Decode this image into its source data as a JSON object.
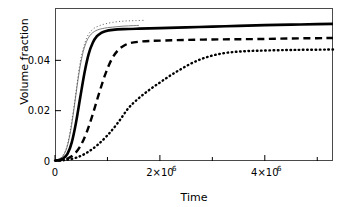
{
  "chart_data": {
    "type": "line",
    "title": "",
    "xlabel": "Time",
    "ylabel": "Volume fraction",
    "xlim": [
      0,
      5300000
    ],
    "ylim": [
      0,
      0.0608
    ],
    "grid": false,
    "legend": "none",
    "xticks": [
      {
        "value": 0,
        "label": "0",
        "major": true
      },
      {
        "value": 1000000,
        "label": "",
        "major": false
      },
      {
        "value": 2000000,
        "label": "2×10",
        "exponent": "6",
        "major": true
      },
      {
        "value": 3000000,
        "label": "",
        "major": false
      },
      {
        "value": 4000000,
        "label": "4×10",
        "exponent": "6",
        "major": true
      },
      {
        "value": 5000000,
        "label": "",
        "major": false
      }
    ],
    "yticks": [
      {
        "value": 0,
        "label": "0"
      },
      {
        "value": 0.02,
        "label": "0.02"
      },
      {
        "value": 0.04,
        "label": "0.04"
      }
    ],
    "series": [
      {
        "name": "thin-solid",
        "style": "solid-thin",
        "color": "#6e6e6e",
        "width": 0.9,
        "points": [
          [
            0,
            0.0003
          ],
          [
            60000,
            0.0006
          ],
          [
            120000,
            0.0013
          ],
          [
            180000,
            0.0029
          ],
          [
            240000,
            0.0063
          ],
          [
            300000,
            0.0122
          ],
          [
            360000,
            0.0204
          ],
          [
            420000,
            0.0296
          ],
          [
            480000,
            0.0377
          ],
          [
            540000,
            0.0436
          ],
          [
            600000,
            0.0474
          ],
          [
            660000,
            0.0497
          ],
          [
            720000,
            0.051
          ],
          [
            780000,
            0.0518
          ],
          [
            840000,
            0.0523
          ],
          [
            900000,
            0.0526
          ],
          [
            1000000,
            0.053
          ],
          [
            1100000,
            0.0532
          ],
          [
            1200000,
            0.0534
          ],
          [
            1300000,
            0.0536
          ],
          [
            1400000,
            0.0537
          ],
          [
            1500000,
            0.0538
          ],
          [
            1600000,
            0.0539
          ]
        ]
      },
      {
        "name": "fine-dotted-overshoot",
        "style": "dotted-fine",
        "color": "#555555",
        "width": 0.9,
        "points": [
          [
            0,
            0.0003
          ],
          [
            120000,
            0.0014
          ],
          [
            240000,
            0.0068
          ],
          [
            360000,
            0.0214
          ],
          [
            480000,
            0.0392
          ],
          [
            600000,
            0.0487
          ],
          [
            720000,
            0.0523
          ],
          [
            840000,
            0.0537
          ],
          [
            960000,
            0.0545
          ],
          [
            1100000,
            0.0551
          ],
          [
            1250000,
            0.0555
          ],
          [
            1400000,
            0.0557
          ],
          [
            1550000,
            0.0558
          ],
          [
            1700000,
            0.0559
          ]
        ]
      },
      {
        "name": "thick-solid",
        "style": "solid-thick",
        "color": "#000000",
        "width": 2.6,
        "points": [
          [
            0,
            0.0002
          ],
          [
            80000,
            0.0004
          ],
          [
            160000,
            0.0011
          ],
          [
            240000,
            0.0029
          ],
          [
            320000,
            0.0074
          ],
          [
            400000,
            0.0152
          ],
          [
            480000,
            0.0251
          ],
          [
            560000,
            0.0348
          ],
          [
            640000,
            0.0424
          ],
          [
            720000,
            0.047
          ],
          [
            800000,
            0.0496
          ],
          [
            880000,
            0.0509
          ],
          [
            960000,
            0.0516
          ],
          [
            1100000,
            0.0521
          ],
          [
            1300000,
            0.0524
          ],
          [
            1600000,
            0.0526
          ],
          [
            2000000,
            0.0528
          ],
          [
            2500000,
            0.0531
          ],
          [
            3000000,
            0.0534
          ],
          [
            3500000,
            0.0537
          ],
          [
            4000000,
            0.054
          ],
          [
            4500000,
            0.0542
          ],
          [
            5000000,
            0.0544
          ],
          [
            5300000,
            0.0545
          ]
        ]
      },
      {
        "name": "dashed",
        "style": "dashed",
        "color": "#000000",
        "width": 2.4,
        "points": [
          [
            0,
            0.0002
          ],
          [
            120000,
            0.0004
          ],
          [
            240000,
            0.001
          ],
          [
            360000,
            0.0026
          ],
          [
            480000,
            0.0058
          ],
          [
            600000,
            0.0112
          ],
          [
            720000,
            0.0186
          ],
          [
            840000,
            0.0269
          ],
          [
            960000,
            0.0345
          ],
          [
            1080000,
            0.0404
          ],
          [
            1200000,
            0.044
          ],
          [
            1320000,
            0.0459
          ],
          [
            1440000,
            0.0469
          ],
          [
            1600000,
            0.0474
          ],
          [
            1800000,
            0.0477
          ],
          [
            2100000,
            0.0479
          ],
          [
            2500000,
            0.0481
          ],
          [
            3000000,
            0.0483
          ],
          [
            3500000,
            0.0484
          ],
          [
            4000000,
            0.0485
          ],
          [
            4500000,
            0.0487
          ],
          [
            5000000,
            0.0488
          ],
          [
            5300000,
            0.0489
          ]
        ]
      },
      {
        "name": "dotted",
        "style": "dotted-thick",
        "color": "#000000",
        "width": 2.4,
        "points": [
          [
            0,
            0.0001
          ],
          [
            200000,
            0.0004
          ],
          [
            400000,
            0.0013
          ],
          [
            600000,
            0.0032
          ],
          [
            800000,
            0.0062
          ],
          [
            1000000,
            0.0102
          ],
          [
            1200000,
            0.0152
          ],
          [
            1400000,
            0.021
          ],
          [
            1600000,
            0.025
          ],
          [
            1800000,
            0.0283
          ],
          [
            2000000,
            0.0312
          ],
          [
            2200000,
            0.034
          ],
          [
            2400000,
            0.0365
          ],
          [
            2600000,
            0.0388
          ],
          [
            2800000,
            0.0406
          ],
          [
            3000000,
            0.0419
          ],
          [
            3200000,
            0.0428
          ],
          [
            3400000,
            0.0433
          ],
          [
            3600000,
            0.0436
          ],
          [
            3800000,
            0.0438
          ],
          [
            4000000,
            0.0439
          ],
          [
            4400000,
            0.0441
          ],
          [
            4800000,
            0.0442
          ],
          [
            5300000,
            0.0443
          ]
        ]
      }
    ]
  },
  "axes": {
    "frame": {
      "left": 55,
      "top": 8,
      "right": 333,
      "bottom": 161
    }
  }
}
